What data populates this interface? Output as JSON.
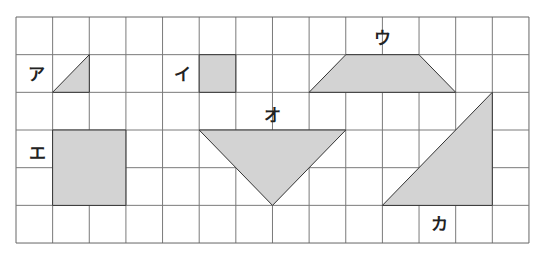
{
  "grid": {
    "columns": 14,
    "rows": 6,
    "origin": [
      16,
      17
    ],
    "cell_width": 36.64,
    "cell_height": 37.67,
    "line_color": "#7a7a7a",
    "border_color": "#666666"
  },
  "shape_fill": "#d3d3d3",
  "shape_stroke": "#333333",
  "shapes": [
    {
      "id": "a",
      "label": "ア",
      "type": "right-triangle",
      "points": [
        [
          1,
          2
        ],
        [
          2,
          1
        ],
        [
          2,
          2
        ]
      ],
      "label_pos": [
        0.55,
        1.5
      ]
    },
    {
      "id": "i",
      "label": "イ",
      "type": "square",
      "points": [
        [
          5,
          1
        ],
        [
          6,
          1
        ],
        [
          6,
          2
        ],
        [
          5,
          2
        ]
      ],
      "label_pos": [
        4.55,
        1.5
      ]
    },
    {
      "id": "u",
      "label": "ウ",
      "type": "trapezoid",
      "points": [
        [
          9,
          1
        ],
        [
          11,
          1
        ],
        [
          12,
          2
        ],
        [
          8,
          2
        ]
      ],
      "label_pos": [
        10.0,
        0.55
      ]
    },
    {
      "id": "e",
      "label": "エ",
      "type": "square",
      "points": [
        [
          1,
          3
        ],
        [
          3,
          3
        ],
        [
          3,
          5
        ],
        [
          1,
          5
        ]
      ],
      "label_pos": [
        0.6,
        3.6
      ]
    },
    {
      "id": "o",
      "label": "オ",
      "type": "triangle",
      "points": [
        [
          5,
          3
        ],
        [
          9,
          3
        ],
        [
          7,
          5
        ]
      ],
      "label_pos": [
        7.0,
        2.6
      ]
    },
    {
      "id": "ka",
      "label": "カ",
      "type": "right-triangle",
      "points": [
        [
          10,
          5
        ],
        [
          13,
          2
        ],
        [
          13,
          5
        ]
      ],
      "label_pos": [
        11.55,
        5.5
      ]
    }
  ]
}
